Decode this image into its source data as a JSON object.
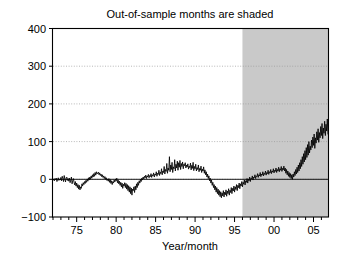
{
  "chart_data": {
    "type": "line",
    "title": "Out-of-sample months are shaded",
    "xlabel": "Year/month",
    "ylabel": "",
    "xlim": [
      1972.0,
      2006.9
    ],
    "ylim": [
      -100,
      400
    ],
    "grid": true,
    "legend": null,
    "annotations": [
      {
        "text": "Out-of-sample months are shaded",
        "kind": "title-note",
        "meaning": "The gray shaded band marks the out-of-sample period."
      }
    ],
    "shaded_region": {
      "label": "Out-of-sample months",
      "color": "#c9c9c9",
      "x_start": 1996.0,
      "x_end": 2006.9
    },
    "x_ticks_major": [
      1975,
      1980,
      1985,
      1990,
      1995,
      2000,
      2005
    ],
    "x_tick_labels": [
      "75",
      "80",
      "85",
      "90",
      "95",
      "00",
      "05"
    ],
    "x_tick_minor_step": 1,
    "y_ticks": [
      -100,
      0,
      100,
      200,
      300,
      400
    ],
    "y_tick_labels": [
      "-100",
      "0",
      "100",
      "200",
      "300",
      "400"
    ],
    "zero_reference_line": 0,
    "series": [
      {
        "name": "Cumulative value",
        "color": "#000000",
        "x_start": 1972.0,
        "x_step": 0.08333,
        "values": [
          -2,
          1,
          -4,
          2,
          -1,
          3,
          -6,
          0,
          4,
          -3,
          1,
          -2,
          5,
          -4,
          8,
          2,
          -6,
          10,
          1,
          -7,
          4,
          6,
          -3,
          2,
          -5,
          3,
          -9,
          -2,
          6,
          -12,
          -4,
          2,
          -8,
          -15,
          -6,
          -18,
          -10,
          -22,
          -14,
          -26,
          -16,
          -28,
          -20,
          -24,
          -12,
          -18,
          -9,
          -14,
          -6,
          -11,
          -3,
          -8,
          1,
          -5,
          4,
          -2,
          6,
          0,
          9,
          3,
          12,
          6,
          15,
          8,
          18,
          11,
          20,
          14,
          16,
          19,
          12,
          17,
          10,
          14,
          7,
          12,
          5,
          9,
          2,
          7,
          0,
          4,
          -3,
          1,
          -5,
          2,
          -8,
          -1,
          -11,
          -4,
          -14,
          -6,
          -10,
          -2,
          -7,
          1,
          -4,
          3,
          -9,
          -2,
          -12,
          -5,
          -16,
          -8,
          -20,
          -10,
          -24,
          -13,
          -18,
          -9,
          -22,
          -11,
          -26,
          -14,
          -30,
          -17,
          -34,
          -20,
          -38,
          -23,
          -42,
          -26,
          -30,
          -20,
          -35,
          -18,
          -28,
          -12,
          -22,
          -8,
          -16,
          -4,
          -10,
          0,
          -6,
          3,
          -2,
          6,
          1,
          8,
          4,
          11,
          2,
          9,
          6,
          13,
          4,
          10,
          7,
          15,
          5,
          12,
          9,
          17,
          6,
          14,
          11,
          20,
          8,
          16,
          13,
          24,
          10,
          19,
          15,
          28,
          12,
          22,
          18,
          34,
          14,
          26,
          21,
          42,
          16,
          30,
          24,
          60,
          20,
          38,
          26,
          45,
          18,
          33,
          28,
          52,
          22,
          40,
          30,
          48,
          24,
          44,
          32,
          50,
          26,
          42,
          34,
          46,
          28,
          40,
          36,
          44,
          30,
          38,
          33,
          41,
          27,
          35,
          31,
          43,
          25,
          37,
          29,
          45,
          23,
          34,
          28,
          40,
          22,
          31,
          26,
          38,
          20,
          29,
          24,
          35,
          18,
          27,
          22,
          33,
          16,
          25,
          12,
          20,
          6,
          14,
          2,
          9,
          -4,
          3,
          -10,
          -2,
          -16,
          -8,
          -22,
          -14,
          -28,
          -18,
          -34,
          -22,
          -38,
          -26,
          -42,
          -30,
          -46,
          -33,
          -49,
          -36,
          -44,
          -30,
          -47,
          -34,
          -41,
          -28,
          -45,
          -31,
          -38,
          -25,
          -42,
          -29,
          -35,
          -22,
          -38,
          -24,
          -31,
          -18,
          -34,
          -20,
          -27,
          -14,
          -30,
          -16,
          -22,
          -10,
          -25,
          -12,
          -18,
          -6,
          -20,
          -8,
          -13,
          -2,
          -15,
          -4,
          -8,
          2,
          -10,
          0,
          -4,
          6,
          -6,
          3,
          1,
          9,
          -2,
          6,
          4,
          12,
          2,
          9,
          7,
          15,
          5,
          12,
          9,
          18,
          7,
          14,
          11,
          20,
          9,
          16,
          13,
          22,
          11,
          18,
          15,
          24,
          13,
          20,
          17,
          26,
          15,
          22,
          19,
          28,
          17,
          24,
          21,
          30,
          18,
          26,
          22,
          32,
          20,
          28,
          24,
          34,
          21,
          29,
          25,
          35,
          22,
          30,
          16,
          26,
          12,
          22,
          8,
          18,
          5,
          15,
          2,
          12,
          0,
          14,
          6,
          20,
          10,
          26,
          14,
          32,
          18,
          38,
          22,
          44,
          28,
          52,
          34,
          60,
          40,
          68,
          46,
          76,
          52,
          84,
          58,
          92,
          64,
          100,
          70,
          88,
          78,
          104,
          84,
          112,
          90,
          120,
          82,
          110,
          96,
          126,
          104,
          134,
          98,
          124,
          110,
          140,
          116,
          148,
          108,
          136,
          122,
          154,
          116,
          146,
          128,
          160,
          120,
          150,
          132,
          166,
          126,
          158,
          138,
          172,
          130,
          164,
          144,
          180,
          136,
          170,
          150,
          188,
          142,
          176,
          156,
          196,
          148,
          184,
          162,
          204,
          154,
          192,
          168,
          212,
          160,
          218,
          150,
          196,
          172,
          216,
          164,
          206,
          178,
          222,
          170,
          212,
          184,
          230,
          176,
          220,
          190,
          238,
          182,
          226,
          196,
          246,
          188,
          234,
          202,
          254,
          194,
          242,
          208,
          262,
          200,
          250,
          214,
          270,
          206,
          258,
          222,
          278,
          214,
          266,
          230,
          286,
          222,
          274,
          238,
          294,
          230,
          282,
          246,
          302,
          238,
          290,
          254,
          312,
          246,
          300,
          262,
          322,
          254,
          310,
          270,
          334,
          262,
          318,
          278,
          346,
          270,
          326,
          286,
          358,
          278,
          334,
          296,
          382,
          286,
          312,
          300,
          268,
          290,
          318,
          296,
          304,
          300,
          314,
          302,
          308,
          306,
          312,
          309,
          316,
          312,
          320,
          316,
          324,
          320,
          328,
          322,
          332,
          326,
          330,
          328,
          334
        ]
      }
    ]
  },
  "axes": {
    "title": "Out-of-sample months are shaded",
    "xlabel": "Year/month",
    "y_tick_labels": [
      "400",
      "300",
      "200",
      "100",
      "0",
      "-100"
    ],
    "x_tick_labels": [
      "75",
      "80",
      "85",
      "90",
      "95",
      "00",
      "05"
    ]
  },
  "colors": {
    "shading": "#c9c9c9",
    "line": "#000000",
    "grid": "#9a9a9a",
    "frame": "#000000",
    "background": "#ffffff"
  }
}
